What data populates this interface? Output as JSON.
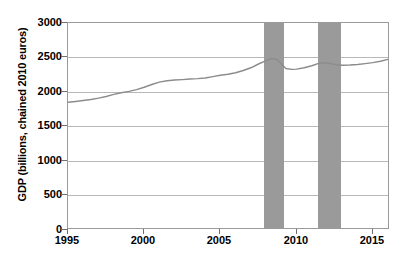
{
  "chart_data": {
    "type": "line",
    "title": "",
    "xlabel": "",
    "ylabel": "GDP (billions, chained 2010 euros)",
    "xlim": [
      1995,
      2016
    ],
    "ylim": [
      0,
      3000
    ],
    "grid": true,
    "legend": null,
    "xticks": [
      1995,
      2000,
      2005,
      2010,
      2015
    ],
    "xtick_labels": [
      "1995",
      "2000",
      "2005",
      "2010",
      "2015"
    ],
    "yticks": [
      0,
      500,
      1000,
      1500,
      2000,
      2500,
      3000
    ],
    "ytick_labels": [
      "0",
      "500",
      "1000",
      "1500",
      "2000",
      "2500",
      "3000"
    ],
    "series": [
      {
        "name": "GDP",
        "color": "#8c8c8c",
        "x": [
          1995.0,
          1995.5,
          1996.0,
          1996.5,
          1997.0,
          1997.5,
          1998.0,
          1998.5,
          1999.0,
          1999.5,
          2000.0,
          2000.5,
          2001.0,
          2001.5,
          2002.0,
          2002.5,
          2003.0,
          2003.5,
          2004.0,
          2004.5,
          2005.0,
          2005.5,
          2006.0,
          2006.5,
          2007.0,
          2007.5,
          2008.0,
          2008.3,
          2008.7,
          2009.0,
          2009.3,
          2009.7,
          2010.0,
          2010.5,
          2011.0,
          2011.4,
          2011.8,
          2012.2,
          2012.6,
          2013.0,
          2013.5,
          2014.0,
          2014.5,
          2015.0,
          2015.5,
          2016.0
        ],
        "values": [
          1840,
          1852,
          1865,
          1880,
          1900,
          1925,
          1955,
          1980,
          2000,
          2025,
          2060,
          2100,
          2135,
          2155,
          2165,
          2172,
          2180,
          2186,
          2196,
          2215,
          2235,
          2250,
          2272,
          2305,
          2345,
          2400,
          2450,
          2478,
          2470,
          2400,
          2335,
          2322,
          2325,
          2345,
          2375,
          2405,
          2418,
          2410,
          2390,
          2382,
          2385,
          2392,
          2405,
          2420,
          2440,
          2468
        ]
      }
    ],
    "shaded_regions": [
      {
        "label": "recession",
        "x0": 2007.8,
        "x1": 2009.1,
        "color": "#9a9a9a"
      },
      {
        "label": "recession",
        "x0": 2011.3,
        "x1": 2012.8,
        "color": "#9a9a9a"
      }
    ]
  }
}
